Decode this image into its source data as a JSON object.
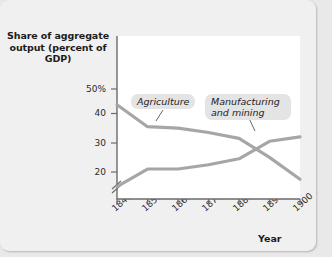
{
  "figure": {
    "background_color": "#f0f0f0",
    "plot_background_color": "#ffffff",
    "axis_color": "#6b6b6b",
    "line_color": "#a6a6a6"
  },
  "chart_data": {
    "type": "line",
    "title": "",
    "ylabel": "Share of aggregate output (percent of GDP)",
    "xlabel": "Year",
    "x": [
      1840,
      1850,
      1860,
      1870,
      1880,
      1890,
      1900
    ],
    "xticklabels": [
      "1840",
      "1850",
      "1860",
      "1870",
      "1880",
      "1890",
      "1900"
    ],
    "yticklabels": [
      "50%",
      "40",
      "30",
      "20"
    ],
    "ytickvalues": [
      50,
      40,
      30,
      20
    ],
    "ylim": [
      13,
      52
    ],
    "xlim": [
      1840,
      1900
    ],
    "axis_break": true,
    "grid": false,
    "legend": "inline-labels",
    "series": [
      {
        "name": "Agriculture",
        "label": "Agriculture",
        "values": [
          43,
          35.5,
          35,
          33.5,
          31.5,
          25,
          17.5
        ]
      },
      {
        "name": "Manufacturing and mining",
        "label": "Manufacturing and mining",
        "values": [
          15,
          21,
          21,
          22.5,
          24.5,
          30.5,
          32
        ]
      }
    ]
  }
}
